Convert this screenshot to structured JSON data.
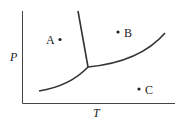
{
  "diagram": {
    "type": "phase-diagram",
    "axes": {
      "x_label": "T",
      "y_label": "P"
    },
    "points": [
      {
        "label": "A",
        "region": "solid"
      },
      {
        "label": "B",
        "region": "liquid"
      },
      {
        "label": "C",
        "region": "gas"
      }
    ],
    "curves": [
      {
        "name": "solid-liquid-boundary"
      },
      {
        "name": "solid-gas-boundary"
      },
      {
        "name": "liquid-gas-boundary"
      }
    ],
    "colors": {
      "line": "#333333",
      "text": "#222222",
      "background": "#ffffff"
    }
  }
}
